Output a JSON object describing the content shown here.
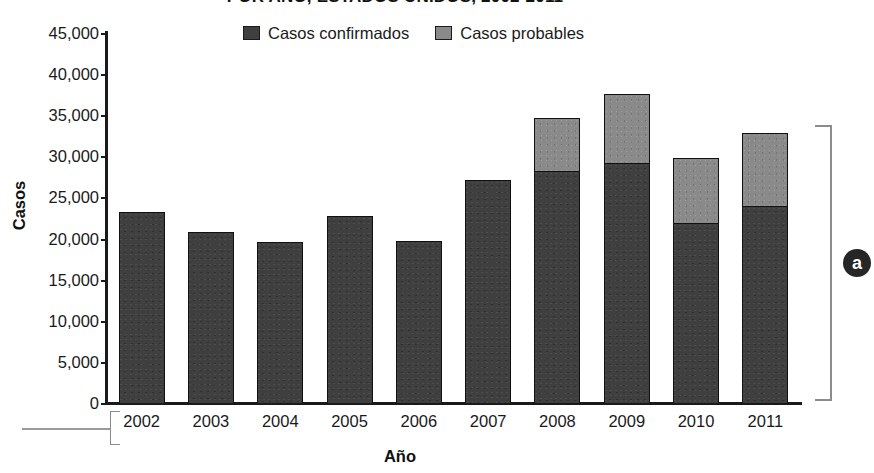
{
  "chart_data": {
    "type": "bar",
    "subtype": "stacked-vertical",
    "title": "POR AÑO, ESTADOS UNIDOS, 2002-2011",
    "xlabel": "Año",
    "ylabel": "Casos",
    "categories": [
      "2002",
      "2003",
      "2004",
      "2005",
      "2006",
      "2007",
      "2008",
      "2009",
      "2010",
      "2011"
    ],
    "series": [
      {
        "name": "Casos confirmados",
        "color": "#3f3f3f",
        "values": [
          23200,
          20800,
          19600,
          22700,
          19700,
          27100,
          28200,
          29200,
          21900,
          24000
        ]
      },
      {
        "name": "Casos probables",
        "color": "#8a8a8a",
        "values": [
          0,
          0,
          0,
          0,
          0,
          0,
          6500,
          8400,
          7900,
          8800
        ]
      }
    ],
    "totals": [
      23200,
      20800,
      19600,
      22700,
      19700,
      27100,
      34700,
      37600,
      29800,
      32800
    ],
    "ylim": [
      0,
      45000
    ],
    "ytick_values": [
      45000,
      40000,
      35000,
      30000,
      25000,
      20000,
      15000,
      10000,
      5000,
      0
    ],
    "ytick_labels": [
      "45,000",
      "40,000",
      "35,000",
      "30,000",
      "25,000",
      "20,000",
      "15,000",
      "10,000",
      "5,000",
      "0"
    ],
    "grid": false,
    "legend_position": "top-center"
  },
  "legend": {
    "items": [
      {
        "label": "Casos confirmados",
        "color": "#3f3f3f"
      },
      {
        "label": "Casos probables",
        "color": "#8a8a8a"
      }
    ]
  },
  "annotations": {
    "panel_badge": "a"
  }
}
